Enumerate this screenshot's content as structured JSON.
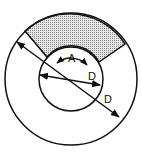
{
  "diagram": {
    "type": "annular-sector",
    "colors": {
      "stroke": "#111111",
      "shade": "#bdbdbd",
      "background": "#ffffff"
    },
    "labels": {
      "angle": "A",
      "inner_diameter": "D",
      "outer_diameter": "D"
    }
  }
}
